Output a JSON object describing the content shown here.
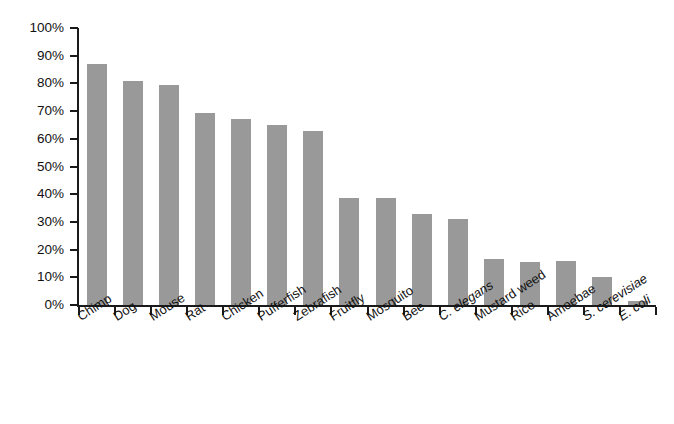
{
  "chart_data": {
    "type": "bar",
    "title": "",
    "subtitle": "",
    "xlabel": "",
    "ylabel": "",
    "ylim": [
      0,
      100
    ],
    "ytick_labels": [
      "100%",
      "90%",
      "80%",
      "70%",
      "60%",
      "50%",
      "40%",
      "30%",
      "20%",
      "10%",
      "0%"
    ],
    "ytick_values": [
      100,
      90,
      80,
      70,
      60,
      50,
      40,
      30,
      20,
      10,
      0
    ],
    "grid": false,
    "legend": "none",
    "bar_color": "#999999",
    "axis_color": "#1a1a1a",
    "categories": [
      "Chimp",
      "Dog",
      "Mouse",
      "Rat",
      "Chicken",
      "Pufferfish",
      "Zebrafish",
      "Fruitfly",
      "Mosquito",
      "Bee",
      "C. elegans",
      "Mustard weed",
      "Rice",
      "Amoebae",
      "S. cerevisiae",
      "E. coli"
    ],
    "category_styles": [
      "normal",
      "normal",
      "normal",
      "normal",
      "normal",
      "normal",
      "normal",
      "normal",
      "normal",
      "normal",
      "italic",
      "normal",
      "normal",
      "normal",
      "italic",
      "italic"
    ],
    "values": [
      87,
      81,
      79.5,
      69.5,
      67,
      65,
      63,
      38.5,
      38.5,
      33,
      31,
      16.5,
      15.5,
      16,
      10,
      1.5
    ]
  }
}
